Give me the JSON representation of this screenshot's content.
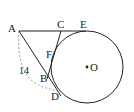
{
  "diagram": {
    "type": "geometry",
    "stroke_color": "#222222",
    "dashed_color": "#888888",
    "circle": {
      "label": "O",
      "cx": 87,
      "cy": 67,
      "r": 36
    },
    "points": {
      "A": {
        "label": "A",
        "x": 19,
        "y": 31
      },
      "C": {
        "label": "C",
        "x": 61,
        "y": 31
      },
      "E": {
        "label": "E",
        "x": 84,
        "y": 31
      },
      "F": {
        "label": "F",
        "x": 54,
        "y": 53
      },
      "B": {
        "label": "B",
        "x": 48,
        "y": 76
      },
      "D": {
        "label": "D",
        "x": 58,
        "y": 91
      }
    },
    "segments": [
      {
        "from": "A",
        "to": "E",
        "style": "solid"
      },
      {
        "from": "A",
        "to": "D",
        "style": "solid"
      },
      {
        "from": "C",
        "to": "B",
        "style": "solid"
      }
    ],
    "arc": {
      "from": "A",
      "to": "D",
      "style": "dashed",
      "label": "14"
    }
  }
}
